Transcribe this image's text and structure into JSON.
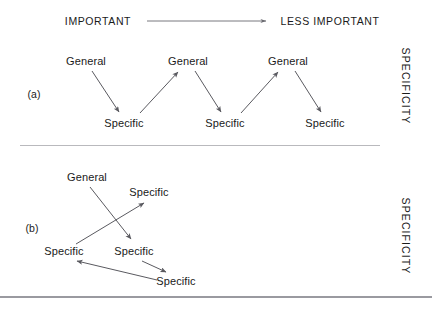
{
  "figure": {
    "header": {
      "left_label": "IMPORTANT",
      "right_label": "LESS IMPORTANT",
      "arrow_direction": "left-to-right"
    },
    "axis": {
      "vertical_label_a": "SPECIFICITY",
      "vertical_label_b": "SPECIFICITY",
      "orientation": "rotated-90-clockwise"
    },
    "panels": [
      {
        "tag": "(a)",
        "description": "Alternating general-to-specific zigzag sequence",
        "nodes": [
          {
            "id": "a-g1",
            "label": "General",
            "x": 86,
            "y": 61
          },
          {
            "id": "a-s1",
            "label": "Specific",
            "x": 124,
            "y": 123
          },
          {
            "id": "a-g2",
            "label": "General",
            "x": 188,
            "y": 61
          },
          {
            "id": "a-s2",
            "label": "Specific",
            "x": 225,
            "y": 123
          },
          {
            "id": "a-g3",
            "label": "General",
            "x": 288,
            "y": 61
          },
          {
            "id": "a-s3",
            "label": "Specific",
            "x": 325,
            "y": 123
          }
        ],
        "edges": [
          {
            "from": "a-g1",
            "to": "a-s1"
          },
          {
            "from": "a-s1",
            "to": "a-g2"
          },
          {
            "from": "a-g2",
            "to": "a-s2"
          },
          {
            "from": "a-s2",
            "to": "a-g3"
          },
          {
            "from": "a-g3",
            "to": "a-s3"
          }
        ]
      },
      {
        "tag": "(b)",
        "description": "Crossing, non-sequential specificity path",
        "nodes": [
          {
            "id": "b-g1",
            "label": "General",
            "x": 87,
            "y": 177
          },
          {
            "id": "b-s1",
            "label": "Specific",
            "x": 149,
            "y": 192
          },
          {
            "id": "b-s2",
            "label": "Specific",
            "x": 64,
            "y": 251
          },
          {
            "id": "b-s3",
            "label": "Specific",
            "x": 134,
            "y": 251
          },
          {
            "id": "b-s4",
            "label": "Specific",
            "x": 176,
            "y": 281
          }
        ],
        "edges": [
          {
            "from": "b-g1",
            "to": "b-s3"
          },
          {
            "from": "b-s2",
            "to": "b-s1"
          },
          {
            "from": "b-s3",
            "to": "b-s4"
          },
          {
            "from": "b-s4",
            "to": "b-s2"
          }
        ]
      }
    ],
    "colors": {
      "stroke": "#5a5a60",
      "text": "#1a1a1a",
      "rule": "#b9b9bd",
      "baseline_rule": "#9a9aa0",
      "background": "#ffffff"
    }
  }
}
